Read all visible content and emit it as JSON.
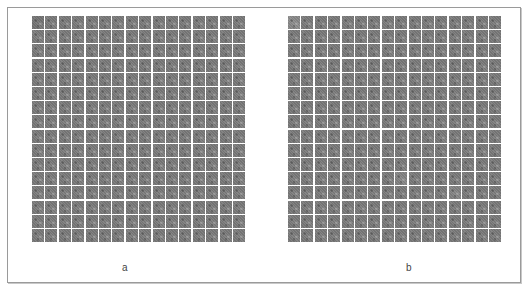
{
  "figure": {
    "panels": [
      {
        "id": "a",
        "label": "a",
        "rows": 16,
        "cols": 16,
        "content": "grid of grayscale noise-texture filter tiles"
      },
      {
        "id": "b",
        "label": "b",
        "rows": 16,
        "cols": 16,
        "content": "grid of grayscale noise-texture filter tiles"
      }
    ],
    "colors": {
      "tile_gray": "#7d7d7d",
      "gap": "#ffffff",
      "border": "#9a9a9a"
    }
  }
}
